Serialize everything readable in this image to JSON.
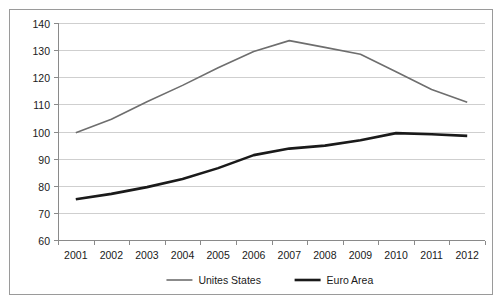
{
  "chart_data": {
    "type": "line",
    "title": "",
    "subtitle": "",
    "xlabel": "",
    "ylabel": "",
    "categories": [
      "2001",
      "2002",
      "2003",
      "2004",
      "2005",
      "2006",
      "2007",
      "2008",
      "2009",
      "2010",
      "2011",
      "2012"
    ],
    "x": [
      2001,
      2002,
      2003,
      2004,
      2005,
      2006,
      2007,
      2008,
      2009,
      2010,
      2011,
      2012
    ],
    "series": [
      {
        "name": "Unites States",
        "color": "#6e6e6e",
        "stroke_width": 1.6,
        "values": [
          99.5,
          104.5,
          111.0,
          117.0,
          123.5,
          129.5,
          133.5,
          131.0,
          128.5,
          122.0,
          115.5,
          110.8
        ]
      },
      {
        "name": "Euro Area",
        "color": "#1a1a1a",
        "stroke_width": 2.6,
        "values": [
          75.0,
          77.0,
          79.5,
          82.5,
          86.5,
          91.3,
          93.7,
          94.8,
          96.8,
          99.4,
          99.0,
          98.4
        ]
      }
    ],
    "ylim": [
      60,
      140
    ],
    "yticks": [
      60,
      70,
      80,
      90,
      100,
      110,
      120,
      130,
      140
    ],
    "ytick_labels": [
      "60",
      "70",
      "80",
      "90",
      "100",
      "110",
      "120",
      "130",
      "140"
    ],
    "grid": true,
    "grid_axis": "y",
    "legend_position": "bottom-center",
    "legend": [
      {
        "label": "Unites States",
        "color": "#6e6e6e",
        "stroke_width": 1.6
      },
      {
        "label": "Euro Area",
        "color": "#1a1a1a",
        "stroke_width": 2.6
      }
    ],
    "background_color": "#ffffff",
    "border_color": "#9a9a9a",
    "gridline_color": "#cfcfcf",
    "axis_color": "#8a8a8a"
  }
}
